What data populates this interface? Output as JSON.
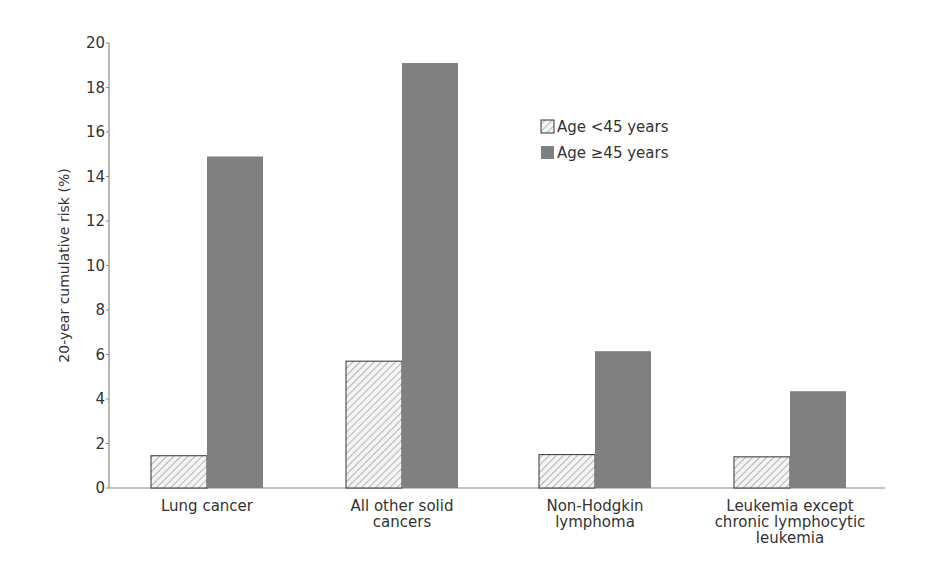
{
  "chart_data": {
    "type": "bar",
    "title": "",
    "xlabel": "",
    "ylabel": "20-year cumulative risk (%)",
    "ylim": [
      0,
      20
    ],
    "yticks": [
      0,
      2,
      4,
      6,
      8,
      10,
      12,
      14,
      16,
      18,
      20
    ],
    "grid": false,
    "legend_position": "upper right (inside plot)",
    "categories": [
      [
        "Lung cancer"
      ],
      [
        "All other solid",
        "cancers"
      ],
      [
        "Non-Hodgkin",
        "lymphoma"
      ],
      [
        "Leukemia except",
        "chronic lymphocytic",
        "leukemia"
      ]
    ],
    "series": [
      {
        "name": "Age <45 years",
        "style": "hatched",
        "values": [
          1.45,
          5.7,
          1.5,
          1.4
        ]
      },
      {
        "name": "Age ≥45 years",
        "style": "solid",
        "color": "#808080",
        "values": [
          14.9,
          19.1,
          6.15,
          4.35
        ]
      }
    ]
  },
  "colors": {
    "solid_bar": "#808080",
    "hatch_line": "#888888",
    "axis": "#888888"
  }
}
